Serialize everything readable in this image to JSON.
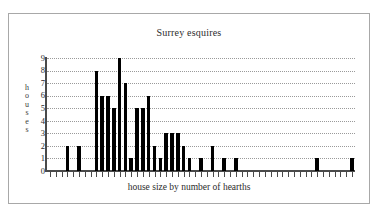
{
  "figure": {
    "title": "Surrey esquires",
    "ylabel_text": "houses",
    "xlabel_text": "house size by number of hearths",
    "frame_color": "#a8a8a8",
    "bar_color": "#000000",
    "axis_color": "#4a4a4a",
    "gridline_color": "#9a9a9a"
  },
  "chart_data": {
    "type": "bar",
    "title": "Surrey esquires",
    "xlabel": "house size by number of hearths",
    "ylabel": "houses",
    "ylim": [
      0,
      9
    ],
    "ytick_labels": [
      "0",
      "1",
      "2",
      "3",
      "4",
      "5",
      "6",
      "7",
      "8",
      "9"
    ],
    "ytick_values": [
      0,
      1,
      2,
      3,
      4,
      5,
      6,
      7,
      8,
      9
    ],
    "grid": true,
    "grid_axis": "y",
    "legend": "none",
    "xtick_labels_visible": false,
    "categories": [
      "1",
      "2",
      "3",
      "4",
      "5",
      "6",
      "7",
      "8",
      "9",
      "10",
      "11",
      "12",
      "13",
      "14",
      "15",
      "16",
      "17",
      "18",
      "19",
      "20",
      "21",
      "22",
      "23",
      "24",
      "25",
      "26",
      "27",
      "28",
      "29",
      "30",
      "31",
      "32",
      "33",
      "34",
      "35",
      "36",
      "37",
      "38",
      "39",
      "40",
      "41",
      "42",
      "43",
      "44",
      "45",
      "46",
      "47",
      "48",
      "49",
      "50",
      "51",
      "52",
      "53"
    ],
    "values": [
      0,
      0,
      0,
      2,
      0,
      2,
      0,
      0,
      8,
      6,
      6,
      5,
      9,
      7,
      1,
      5,
      5,
      6,
      2,
      1,
      3,
      3,
      3,
      2,
      1,
      0,
      1,
      0,
      2,
      0,
      1,
      0,
      1,
      0,
      0,
      0,
      0,
      0,
      0,
      0,
      0,
      0,
      0,
      0,
      0,
      0,
      1,
      0,
      0,
      0,
      0,
      0,
      1
    ]
  }
}
